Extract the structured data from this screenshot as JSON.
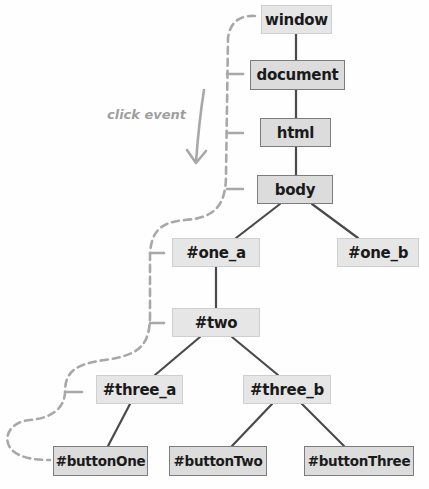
{
  "diagram": {
    "annotation": {
      "label": "click event",
      "arrow": "down-arrow"
    },
    "colors": {
      "node_fill": "#e3e3e3",
      "node_border_light": "#cfcfcf",
      "node_border_dark": "#7c7c7c",
      "tree_edge": "#4a4a4a",
      "event_path": "#a8a8a8",
      "annotation_text": "#9f9f9f"
    },
    "nodes": [
      {
        "id": "window",
        "label": "window",
        "x": 261,
        "y": 5,
        "w": 71,
        "h": 29,
        "style": "light"
      },
      {
        "id": "document",
        "label": "document",
        "x": 250,
        "y": 60,
        "w": 95,
        "h": 30,
        "style": "dark"
      },
      {
        "id": "html",
        "label": "html",
        "x": 260,
        "y": 118,
        "w": 71,
        "h": 29,
        "style": "dark"
      },
      {
        "id": "body",
        "label": "body",
        "x": 257,
        "y": 175,
        "w": 76,
        "h": 29,
        "style": "dark"
      },
      {
        "id": "one_a",
        "label": "#one_a",
        "x": 172,
        "y": 238,
        "w": 88,
        "h": 29,
        "style": "light"
      },
      {
        "id": "one_b",
        "label": "#one_b",
        "x": 337,
        "y": 238,
        "w": 82,
        "h": 29,
        "style": "light"
      },
      {
        "id": "two",
        "label": "#two",
        "x": 172,
        "y": 308,
        "w": 88,
        "h": 29,
        "style": "light"
      },
      {
        "id": "three_a",
        "label": "#three_a",
        "x": 96,
        "y": 375,
        "w": 87,
        "h": 29,
        "style": "light"
      },
      {
        "id": "three_b",
        "label": "#three_b",
        "x": 243,
        "y": 375,
        "w": 88,
        "h": 29,
        "style": "light"
      },
      {
        "id": "buttonOne",
        "label": "#buttonOne",
        "x": 53,
        "y": 446,
        "w": 95,
        "h": 30,
        "style": "dark"
      },
      {
        "id": "buttonTwo",
        "label": "#buttonTwo",
        "x": 169,
        "y": 446,
        "w": 98,
        "h": 30,
        "style": "dark"
      },
      {
        "id": "buttonThree",
        "label": "#buttonThree",
        "x": 304,
        "y": 446,
        "w": 110,
        "h": 30,
        "style": "dark"
      }
    ],
    "edges": [
      [
        "window",
        "document"
      ],
      [
        "document",
        "html"
      ],
      [
        "html",
        "body"
      ],
      [
        "body",
        "one_a"
      ],
      [
        "body",
        "one_b"
      ],
      [
        "one_a",
        "two"
      ],
      [
        "two",
        "three_a"
      ],
      [
        "two",
        "three_b"
      ],
      [
        "three_a",
        "buttonOne"
      ],
      [
        "three_b",
        "buttonTwo"
      ],
      [
        "three_b",
        "buttonThree"
      ]
    ],
    "event_path_order": [
      "window",
      "document",
      "html",
      "body",
      "one_a",
      "two",
      "three_a",
      "buttonOne"
    ]
  }
}
